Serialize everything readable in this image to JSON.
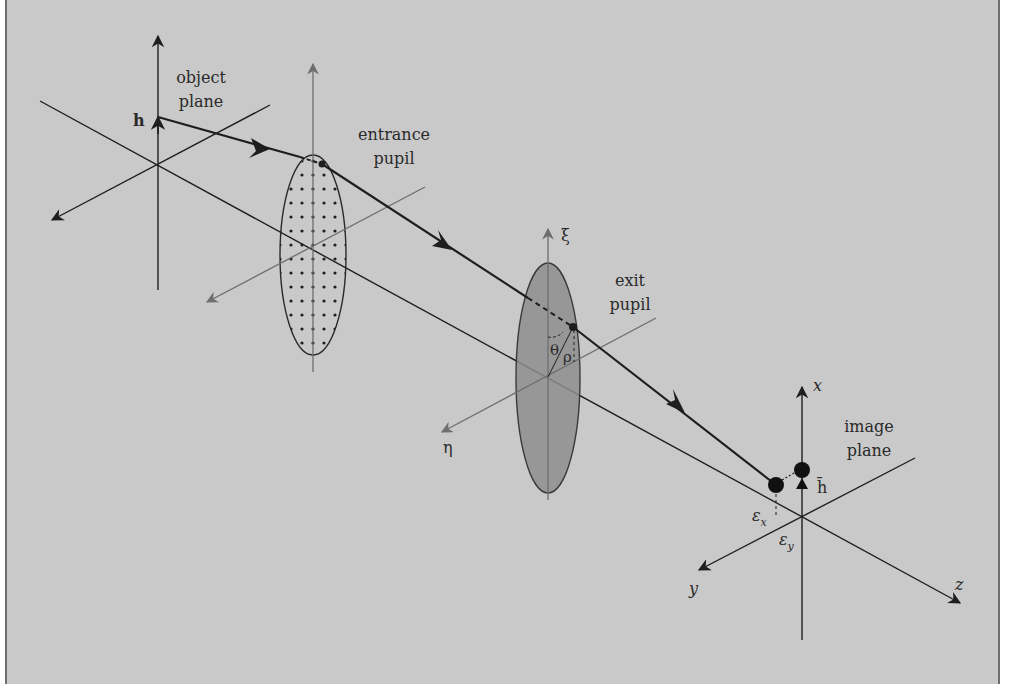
{
  "figure": {
    "type": "optical-system-ray-trace",
    "background_color": "#c9c9c9",
    "line_color": "#1e1e1e",
    "secondary_axis_color": "#707070",
    "exit_pupil_fill": "#8e8e8e"
  },
  "labels": {
    "object_plane": [
      "object",
      "plane"
    ],
    "entrance_pupil": [
      "entrance",
      "pupil"
    ],
    "exit_pupil": [
      "exit",
      "pupil"
    ],
    "image_plane": [
      "image",
      "plane"
    ],
    "object_height": "h",
    "image_height": "h̄",
    "xi_axis": "ξ",
    "eta_axis": "η",
    "theta": "θ",
    "rho": "ρ",
    "x_axis": "x",
    "y_axis": "y",
    "z_axis": "z",
    "epsilon_x": "ε",
    "epsilon_x_sub": "x",
    "epsilon_y": "ε",
    "epsilon_y_sub": "y"
  },
  "elements": [
    {
      "name": "object-plane",
      "origin": [
        158,
        165
      ]
    },
    {
      "name": "entrance-pupil",
      "center": [
        313,
        250
      ],
      "style": "dotted-grid"
    },
    {
      "name": "exit-pupil",
      "center": [
        548,
        377
      ],
      "style": "shaded"
    },
    {
      "name": "image-plane",
      "origin": [
        802,
        516
      ]
    }
  ]
}
